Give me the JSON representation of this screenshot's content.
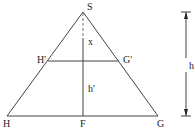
{
  "diagram": {
    "type": "geometry",
    "points": {
      "S": {
        "label": "S",
        "x": 83,
        "y": 12
      },
      "H": {
        "label": "H",
        "x": 7,
        "y": 116
      },
      "G": {
        "label": "G",
        "x": 158,
        "y": 116
      },
      "F": {
        "label": "F",
        "x": 83,
        "y": 116
      },
      "H_prime": {
        "label": "H'",
        "x": 48,
        "y": 61
      },
      "G_prime": {
        "label": "G'",
        "x": 119,
        "y": 61
      }
    },
    "segment_labels": {
      "x": "x",
      "h_prime": "h'",
      "h": "h"
    },
    "colors": {
      "line": "#444444",
      "dashed": "#777777",
      "text": "#222222",
      "background": "#ffffff"
    }
  }
}
